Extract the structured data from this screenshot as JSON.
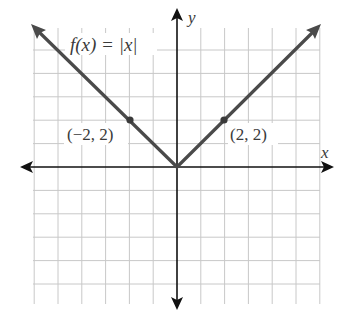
{
  "chart_data": {
    "type": "line",
    "title": "",
    "function_label": "f(x) = |x|",
    "xlabel": "x",
    "ylabel": "y",
    "xlim": [
      -6,
      6
    ],
    "ylim": [
      -5.5,
      6
    ],
    "grid": true,
    "grid_x_lines": [
      -6,
      -5,
      -4,
      -3,
      -2,
      -1,
      1,
      2,
      3,
      4,
      5,
      6
    ],
    "grid_y_lines": [
      -5,
      -4,
      -3,
      -2,
      -1,
      1,
      2,
      3,
      4,
      5
    ],
    "series": [
      {
        "name": "f(x) = |x|",
        "x": [
          -6,
          -5,
          -4,
          -3,
          -2,
          -1,
          0,
          1,
          2,
          3,
          4,
          5,
          6
        ],
        "y": [
          6,
          5,
          4,
          3,
          2,
          1,
          0,
          1,
          2,
          3,
          4,
          5,
          6
        ],
        "color": "#4a4a4a"
      }
    ],
    "points": [
      {
        "x": -2,
        "y": 2,
        "label": "(−2, 2)"
      },
      {
        "x": 2,
        "y": 2,
        "label": "(2, 2)"
      }
    ],
    "annotations": [
      "f(x) = |x|",
      "(−2, 2)",
      "(2, 2)"
    ]
  },
  "colors": {
    "grid": "#c8c8c8",
    "axis": "#111111",
    "curve": "#4a4a4a",
    "text": "#3a3a3a"
  }
}
